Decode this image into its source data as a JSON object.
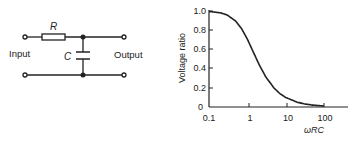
{
  "circuit": {
    "resistor_label": "R",
    "capacitor_label": "C",
    "input_label": "Input",
    "output_label": "Output",
    "type": "RC low-pass filter"
  },
  "chart_data": {
    "type": "line",
    "title": "",
    "xlabel": "ωRC",
    "ylabel": "Voltage ratio",
    "xscale": "log",
    "xlim": [
      0.1,
      300
    ],
    "ylim": [
      0,
      1.0
    ],
    "x_ticks": [
      "0.1",
      "1",
      "10",
      "100"
    ],
    "y_ticks": [
      "0",
      "0.2",
      "0.4",
      "0.6",
      "0.8",
      "1.0"
    ],
    "grid": false,
    "legend": null,
    "series": [
      {
        "name": "Voltage ratio = 1/sqrt(1+(ωRC)^2)",
        "x": [
          0.1,
          0.2,
          0.3,
          0.5,
          0.7,
          1,
          1.5,
          2,
          3,
          5,
          7,
          10,
          20,
          30,
          50,
          100
        ],
        "y": [
          0.995,
          0.981,
          0.958,
          0.894,
          0.819,
          0.707,
          0.555,
          0.447,
          0.316,
          0.196,
          0.141,
          0.0995,
          0.05,
          0.033,
          0.02,
          0.01
        ]
      }
    ]
  }
}
